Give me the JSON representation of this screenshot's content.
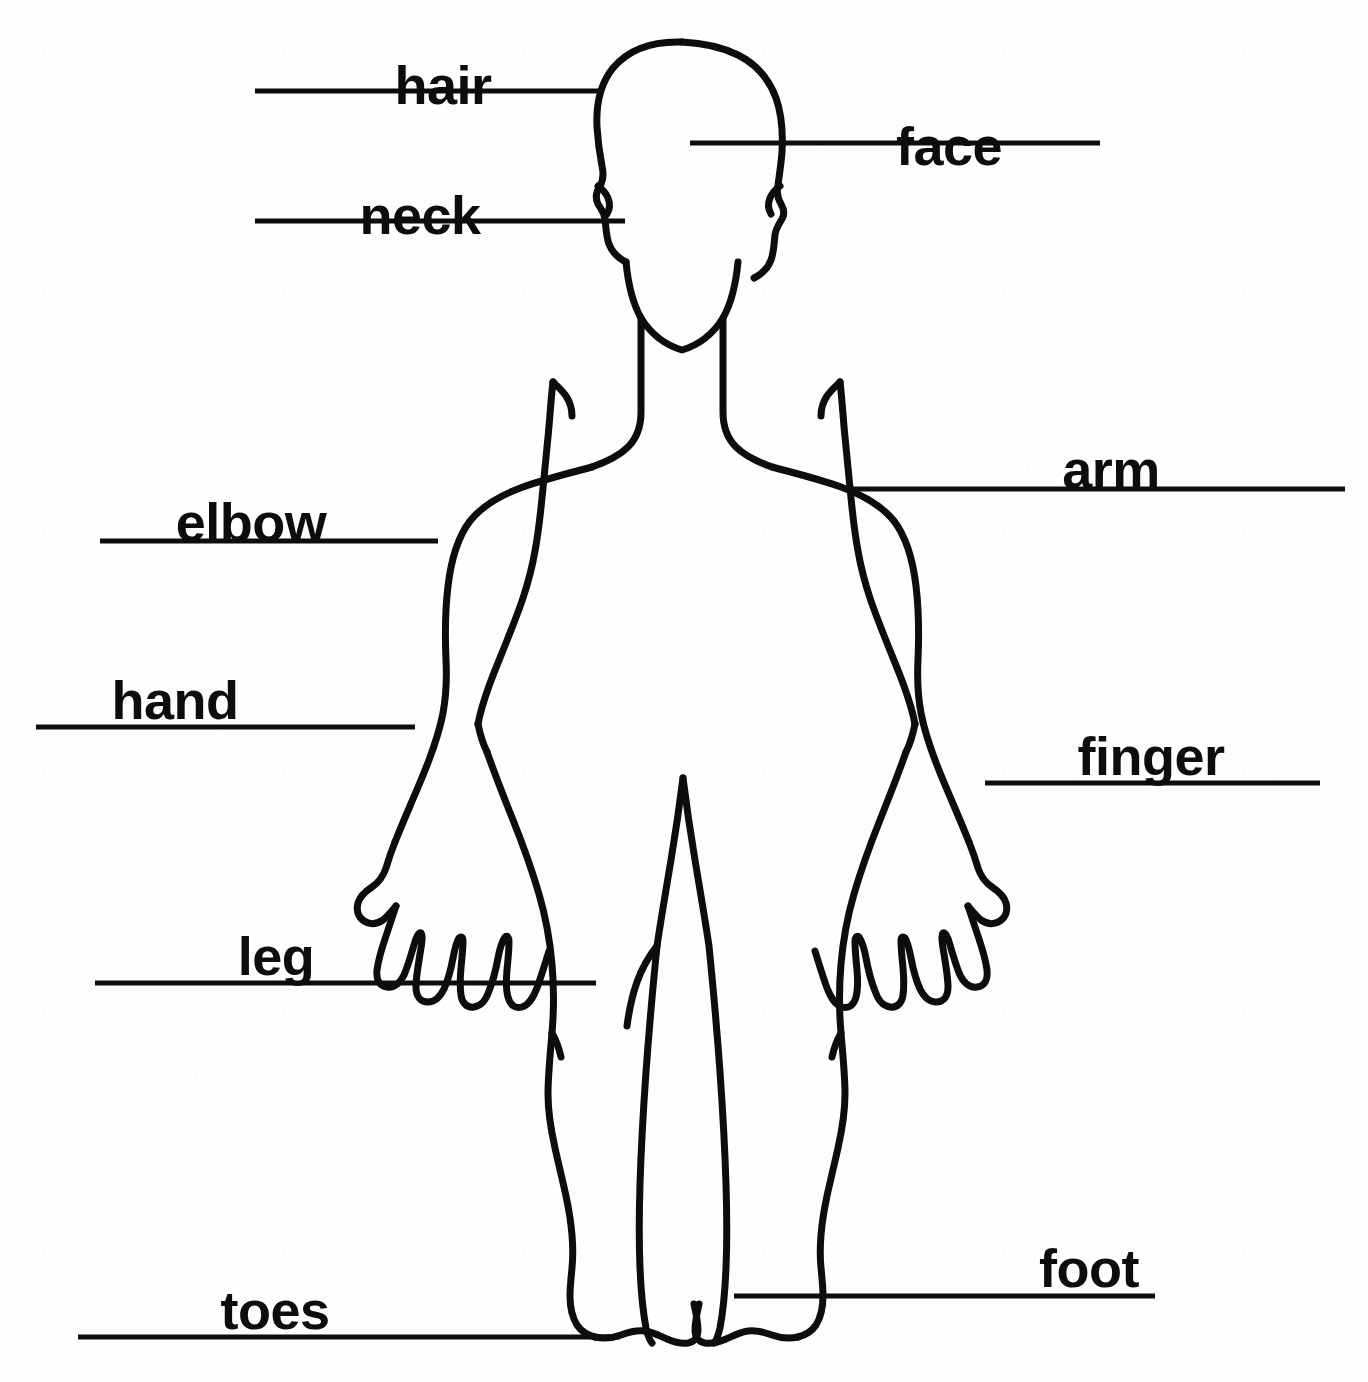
{
  "document": {
    "title": "Body Parts Labeled Diagram",
    "background_color": "#fefefe",
    "ink_color": "#0d0d0d",
    "figure_name": "human-body-outline"
  },
  "labels": [
    {
      "id": "hair",
      "text": "hair",
      "text_x": 443,
      "text_y": 58,
      "line_x1": 255,
      "line_x2": 600,
      "line_y": 91
    },
    {
      "id": "face",
      "text": "face",
      "text_x": 949,
      "text_y": 119,
      "line_x1": 690,
      "line_x2": 1100,
      "line_y": 143
    },
    {
      "id": "neck",
      "text": "neck",
      "text_x": 420,
      "text_y": 188,
      "line_x1": 255,
      "line_x2": 625,
      "line_y": 221
    },
    {
      "id": "arm",
      "text": "arm",
      "text_x": 1111,
      "text_y": 442,
      "line_x1": 849,
      "line_x2": 1345,
      "line_y": 489
    },
    {
      "id": "elbow",
      "text": "elbow",
      "text_x": 251,
      "text_y": 495,
      "line_x1": 100,
      "line_x2": 438,
      "line_y": 541
    },
    {
      "id": "hand",
      "text": "hand",
      "text_x": 175,
      "text_y": 673,
      "line_x1": 36,
      "line_x2": 415,
      "line_y": 727
    },
    {
      "id": "finger",
      "text": "finger",
      "text_x": 1151,
      "text_y": 729,
      "line_x1": 985,
      "line_x2": 1320,
      "line_y": 783
    },
    {
      "id": "leg",
      "text": "leg",
      "text_x": 276,
      "text_y": 929,
      "line_x1": 95,
      "line_x2": 596,
      "line_y": 983
    },
    {
      "id": "foot",
      "text": "foot",
      "text_x": 1089,
      "text_y": 1241,
      "line_x1": 734,
      "line_x2": 1155,
      "line_y": 1296
    },
    {
      "id": "toes",
      "text": "toes",
      "text_x": 275,
      "text_y": 1283,
      "line_x1": 78,
      "line_x2": 620,
      "line_y": 1337
    }
  ],
  "figure": {
    "stroke_width": 7,
    "outline_path": "M 682 40 C 651 38 625 49 610 70 C 597 88 594 112 595 133 C 596 152 599 168 601 178 C 603 188 601 192 598 196 C 594 200 592 205 595 211 C 598 217 602 219 603 226 C 604 234 604 244 607 252 C 610 260 617 266 626 270 C 631 272 633 275 632 281 C 631 290 630 298 633 306 C 640 322 655 336 672 344 C 682 349 690 352 697 354 C 702 355 706 357 708 360 C 711 366 711 374 709 382 C 706 394 700 405 690 413 C 680 421 666 426 650 431 C 620 440 580 449 547 463 C 520 475 498 492 483 514 C 470 533 463 556 460 581 C 456 613 457 647 459 676 C 461 702 462 722 458 742 C 454 763 446 784 437 806 C 428 828 420 848 414 865 C 409 879 405 891 403 899 C 400 910 396 917 391 921 C 385 926 377 929 370 933 C 363 937 358 943 358 951 C 358 958 363 963 370 964 C 377 965 383 962 388 958 C 393 954 397 949 400 945 C 403 941 405 940 406 941 C 407 943 405 948 402 955 C 398 965 393 977 389 988 C 385 999 382 1009 381 1017 C 380 1026 383 1032 390 1034 C 397 1036 404 1032 409 1025 C 414 1018 418 1009 421 1000 C 424 991 427 983 429 979 C 430 976 432 976 432 979 C 433 984 431 993 429 1003 C 427 1014 425 1025 425 1034 C 425 1043 429 1049 436 1050 C 443 1051 449 1046 453 1039 C 457 1031 460 1021 462 1011 C 464 1001 466 993 468 988 C 469 985 471 985 471 988 C 472 993 471 1001 470 1010 C 469 1020 468 1029 469 1036 C 470 1044 474 1049 481 1049 C 488 1049 493 1044 497 1036 C 501 1027 504 1016 507 1006 C 510 996 512 988 514 983 C 516 979 518 978 519 981 C 520 985 519 992 518 1000 C 516 1010 514 1020 514 1028 C 515 1036 519 1041 526 1040 C 533 1039 538 1033 542 1024 C 547 1013 551 1000 556 986 C 561 972 566 958 572 946 C 578 934 584 925 591 918 C 598 911 606 907 614 905 C 622 903 630 902 638 902 L 668 902 C 682 902 694 906 703 914 C 712 922 718 933 722 945 C 726 957 728 971 729 984 C 730 997 730 1010 730 1022 C 730 1047 729 1070 728 1090 C 727 1110 725 1128 722 1144 C 719 1160 715 1175 710 1190 C 704 1208 697 1226 691 1244 L 688 1252 L 685 1259 L 682 1266 C 679 1272 675 1277 671 1282 C 666 1288 661 1293 656 1298 C 651 1303 646 1307 642 1311 C 637 1315 633 1319 631 1323 C 628 1328 628 1333 631 1337 C 634 1341 640 1343 648 1343 C 656 1343 665 1341 675 1339 C 685 1337 696 1335 707 1334 C 718 1333 728 1333 737 1335 C 746 1337 753 1340 758 1344 C 762 1347 768 1348 773 1345 C 778 1342 781 1336 782 1328 C 783 1320 782 1310 780 1300 C 778 1290 776 1280 775 1270 C 774 1260 774 1250 776 1241 L 779 1230 L 783 1216 C 787 1200 791 1183 794 1165 C 797 1147 799 1128 801 1108 C 803 1088 804 1067 805 1046 C 806 1025 806 1004 806 984 C 806 964 805 945 804 927 L 803 918 L 802 908 C 802 906 802 904 803 903 C 805 902 808 903 811 906 C 815 910 819 917 823 925 C 827 933 831 943 835 953 C 839 963 843 973 847 981 C 851 990 856 996 862 997 C 868 998 873 994 875 987 C 877 980 876 970 874 960 C 872 950 869 940 868 932 C 867 925 868 921 871 921 C 874 921 877 925 880 931 C 883 937 886 945 889 954 C 892 963 895 972 899 980 C 903 988 907 993 913 994 C 919 995 924 991 926 984 C 928 977 928 968 926 958 C 924 948 921 938 919 930 C 917 923 917 919 919 918 C 921 917 925 920 929 926 C 933 932 937 940 941 949 C 945 958 949 967 954 975 C 959 983 964 988 970 989 C 976 990 981 986 983 979 C 985 972 984 963 982 954 C 980 945 977 936 975 929 C 973 923 973 919 975 918 C 977 917 981 919 985 924 C 989 929 993 936 998 943 C 1003 950 1008 957 1014 962 C 1020 967 1027 970 1034 968 C 1041 966 1045 959 1044 951 C 1043 943 1037 936 1030 931 C 1023 926 1015 923 1008 919 C 1001 915 995 910 992 902 C 989 893 986 881 982 868 C 977 852 970 833 962 813 C 954 793 946 773 941 754 C 936 736 934 717 935 694 C 937 665 939 632 936 601 C 933 573 926 548 912 527 C 897 504 875 487 848 474 C 814 459 773 449 743 440 C 726 435 712 430 702 422 C 692 414 686 403 683 391 C 681 383 681 375 684 369 C 686 366 690 364 695 363 C 702 361 710 358 720 353 C 737 345 752 331 759 315 C 762 307 761 299 760 290 C 759 284 761 281 766 279 C 775 275 782 269 785 261 C 788 253 788 243 789 235 C 790 228 794 226 797 220 C 800 214 798 209 794 205 C 791 201 789 197 791 187 C 793 177 796 161 797 142 C 798 121 795 97 782 79 C 767 58 741 47 710 45 C 700 44 691 41 682 40 Z",
    "neck_left_path": "M 649 437 C 645 447 638 454 628 460 C 618 466 607 470 598 474",
    "neck_right_path": "M 742 437 C 746 447 753 454 763 460 C 773 466 784 470 793 474",
    "armpit_left_path": "M 553 383 C 551 392 551 401 552 411 C 553 421 555 430 557 437",
    "armpit_right_path": "M 840 383 C 842 392 842 401 841 411 C 840 421 838 430 836 437",
    "inner_arm_left_path": "M 553 383 C 551 402 549 424 547 447 C 545 470 543 493 541 514 C 539 536 537 556 535 573 C 533 590 531 604 528 616 C 525 629 521 641 516 654 C 511 667 505 680 500 692 C 495 704 491 714 389 0",
    "inner_arm_right_path": "M 840 383 C 842 402 844 424 846 447 C 848 470 850 493 852 514 C 854 536 856 556 858 573 C 860 590 862 604 865 616 C 868 629 872 641 877 654 C 882 667 888 680 893 692",
    "crotch_path": "M 682 778 C 680 800 676 828 671 858 C 666 888 660 918 655 946",
    "crotch_right_path": "M 682 778 C 684 800 688 828 693 858 C 698 888 704 918 709 946",
    "inner_leg_left_path": "M 655 946 C 651 986 647 1030 644 1072 C 641 1114 639 1152 638 1184 C 637 1216 637 1244 638 1268 C 639 1292 641 1312 643 1328",
    "inner_leg_right_path": "M 709 946 C 713 986 717 1030 720 1072 C 723 1114 725 1152 726 1184 C 727 1216 727 1244 726 1268 C 725 1292 723 1312 721 1328",
    "hand_left_notch_path": "M 402 684 C 398 694 394 704 391 714 C 388 724 386 732 385 739",
    "hand_right_notch_path": "M 962 684 C 966 694 970 704 973 714 C 976 724 978 732 979 739"
  }
}
